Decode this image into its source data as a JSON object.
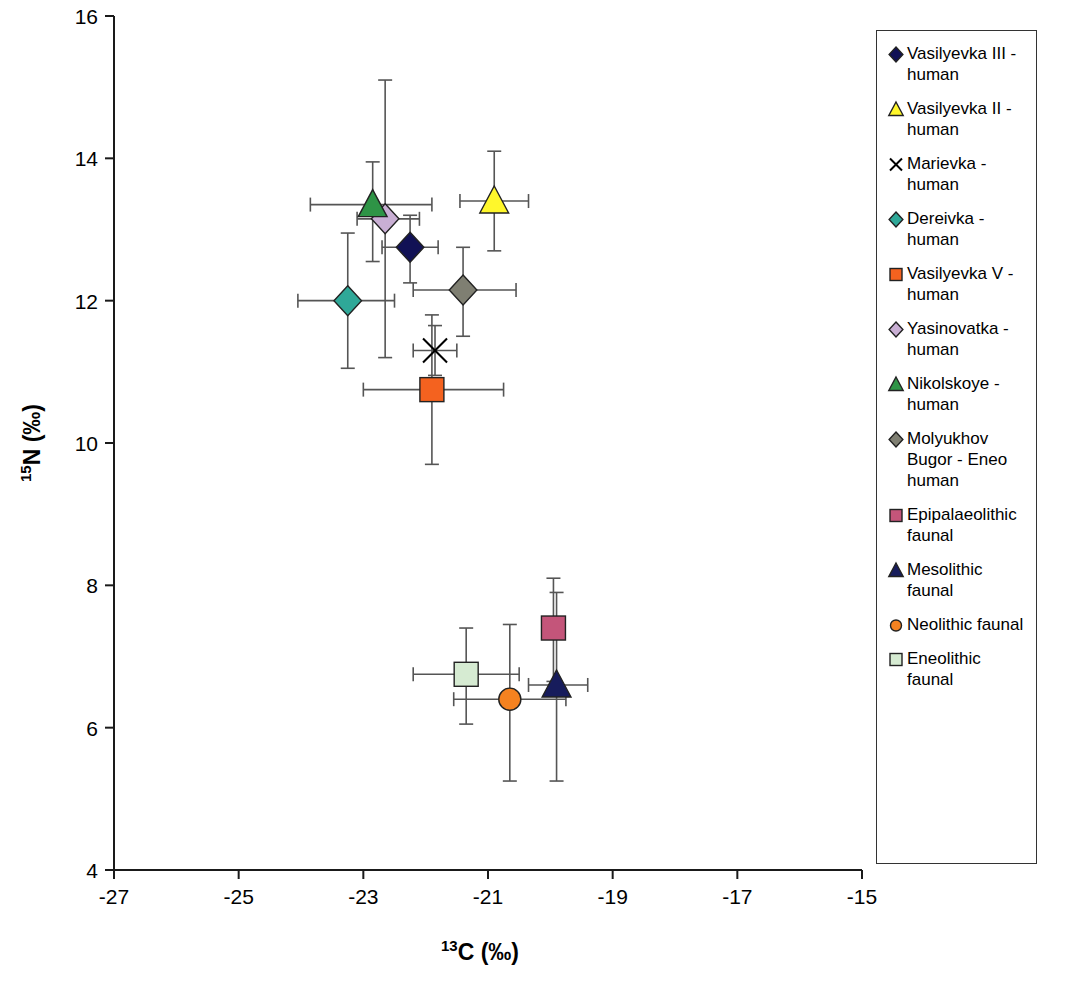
{
  "chart_data": {
    "type": "scatter",
    "title": "",
    "xlabel": "13C (‰)",
    "ylabel": "15N (‰)",
    "xlabel_sup": "13",
    "xlabel_base": "C (‰)",
    "ylabel_sup": "15",
    "ylabel_base": "N (‰)",
    "xlim": [
      -27,
      -15
    ],
    "ylim": [
      4,
      16
    ],
    "xticks": [
      "-27",
      "-25",
      "-23",
      "-21",
      "-19",
      "-17",
      "-15"
    ],
    "xtick_values": [
      -27,
      -25,
      -23,
      -21,
      -19,
      -17,
      -15
    ],
    "yticks": [
      "4",
      "6",
      "8",
      "10",
      "12",
      "14",
      "16"
    ],
    "ytick_values": [
      4,
      6,
      8,
      10,
      12,
      14,
      16
    ],
    "grid": false,
    "legend_position": "right-outside",
    "series": [
      {
        "name": "Vasilyevka III - human",
        "marker": "diamond",
        "color": "#111155",
        "x": -22.25,
        "y": 12.75,
        "xerr_low": -22.7,
        "xerr_high": -21.8,
        "yerr_low": 12.25,
        "yerr_high": 13.2
      },
      {
        "name": "Vasilyevka II - human",
        "marker": "triangle",
        "color": "#FFF72B",
        "x": -20.9,
        "y": 13.4,
        "xerr_low": -21.45,
        "xerr_high": -20.35,
        "yerr_low": 12.7,
        "yerr_high": 14.1
      },
      {
        "name": "Marievka - human",
        "marker": "cross-x",
        "color": "#000000",
        "x": -21.85,
        "y": 11.3,
        "xerr_low": -22.2,
        "xerr_high": -21.5,
        "yerr_low": 10.95,
        "yerr_high": 11.65
      },
      {
        "name": "Dereivka - human",
        "marker": "diamond",
        "color": "#2FA898",
        "x": -23.25,
        "y": 12.0,
        "xerr_low": -24.05,
        "xerr_high": -22.5,
        "yerr_low": 11.05,
        "yerr_high": 12.95
      },
      {
        "name": "Vasilyevka V - human",
        "marker": "square",
        "color": "#F4621F",
        "x": -21.9,
        "y": 10.75,
        "xerr_low": -23.0,
        "xerr_high": -20.75,
        "yerr_low": 9.7,
        "yerr_high": 11.8
      },
      {
        "name": "Yasinovatka - human",
        "marker": "diamond",
        "color": "#C9AFD4",
        "x": -22.65,
        "y": 13.15,
        "xerr_low": -23.1,
        "xerr_high": -22.1,
        "yerr_low": 11.2,
        "yerr_high": 15.1
      },
      {
        "name": "Nikolskoye - human",
        "marker": "triangle",
        "color": "#2E9446",
        "x": -22.85,
        "y": 13.35,
        "xerr_low": -23.85,
        "xerr_high": -21.9,
        "yerr_low": 12.55,
        "yerr_high": 13.95
      },
      {
        "name": "Molyukhov Bugor - Eneo human",
        "marker": "diamond",
        "color": "#7F7F72",
        "x": -21.4,
        "y": 12.15,
        "xerr_low": -22.2,
        "xerr_high": -20.55,
        "yerr_low": 11.5,
        "yerr_high": 12.75
      },
      {
        "name": "Epipalaeolithic faunal",
        "marker": "square",
        "color": "#C4557A",
        "x": -19.95,
        "y": 7.4,
        "xerr_low": -19.95,
        "xerr_high": -19.95,
        "yerr_low": 6.65,
        "yerr_high": 8.1
      },
      {
        "name": "Mesolithic faunal",
        "marker": "triangle",
        "color": "#171C5C",
        "x": -19.9,
        "y": 6.6,
        "xerr_low": -20.35,
        "xerr_high": -19.4,
        "yerr_low": 5.25,
        "yerr_high": 7.9
      },
      {
        "name": "Neolithic faunal",
        "marker": "circle",
        "color": "#F58220",
        "x": -20.65,
        "y": 6.4,
        "xerr_low": -21.55,
        "xerr_high": -19.75,
        "yerr_low": 5.25,
        "yerr_high": 7.45
      },
      {
        "name": "Eneolithic faunal",
        "marker": "square",
        "color": "#D6EBD2",
        "x": -21.35,
        "y": 6.75,
        "xerr_low": -22.2,
        "xerr_high": -20.5,
        "yerr_low": 6.05,
        "yerr_high": 7.4
      }
    ]
  },
  "legend": {
    "items": [
      {
        "label": "Vasilyevka III - human",
        "marker": "diamond",
        "color": "#111155"
      },
      {
        "label": "Vasilyevka II - human",
        "marker": "triangle",
        "color": "#FFF72B"
      },
      {
        "label": "Marievka - human",
        "marker": "cross-x",
        "color": "#000000"
      },
      {
        "label": "Dereivka - human",
        "marker": "diamond",
        "color": "#2FA898"
      },
      {
        "label": "Vasilyevka V - human",
        "marker": "square",
        "color": "#F4621F"
      },
      {
        "label": "Yasinovatka - human",
        "marker": "diamond",
        "color": "#C9AFD4"
      },
      {
        "label": "Nikolskoye - human",
        "marker": "triangle",
        "color": "#2E9446"
      },
      {
        "label": "Molyukhov Bugor - Eneo human",
        "marker": "diamond",
        "color": "#7F7F72"
      },
      {
        "label": "Epipalaeolithic faunal",
        "marker": "square",
        "color": "#C4557A"
      },
      {
        "label": "Mesolithic faunal",
        "marker": "triangle",
        "color": "#171C5C"
      },
      {
        "label": "Neolithic faunal",
        "marker": "circle",
        "color": "#F58220"
      },
      {
        "label": "Eneolithic faunal",
        "marker": "square",
        "color": "#D6EBD2"
      }
    ]
  }
}
